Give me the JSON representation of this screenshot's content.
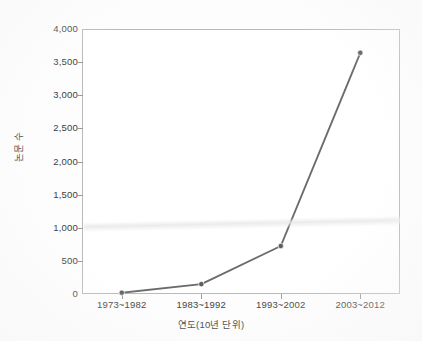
{
  "chart_data": {
    "type": "line",
    "title": "",
    "xlabel": "연도(10년 단위)",
    "ylabel": "논문 수",
    "categories": [
      "1973~1982",
      "1983~1992",
      "1993~2002",
      "2003~2012"
    ],
    "values": [
      20,
      150,
      725,
      3640
    ],
    "series": [
      {
        "name": "논문 수",
        "values": [
          20,
          150,
          725,
          3640
        ]
      }
    ],
    "ylim": [
      0,
      4000
    ],
    "ytick_labels": [
      "0",
      "500",
      "1,000",
      "1,500",
      "2,000",
      "2,500",
      "3,000",
      "3,500",
      "4,000"
    ],
    "ytick_values": [
      0,
      500,
      1000,
      1500,
      2000,
      2500,
      3000,
      3500,
      4000
    ],
    "grid": false,
    "legend": "none",
    "marker": "circle",
    "line_color": "#6b6b6b",
    "marker_color": "#5e5e5e",
    "frame_color": "#b9b9b9",
    "text_color": "#3c3c3c",
    "background": "#ffffff"
  }
}
